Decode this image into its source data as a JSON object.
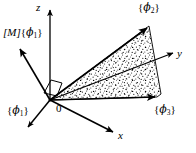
{
  "figure": {
    "background_color": "#ffffff",
    "line_color": "#000000",
    "stipple_color": "#000000",
    "width": 196,
    "height": 153
  },
  "axes": [
    {
      "id": "z",
      "label": "z",
      "from": [
        50,
        100
      ],
      "to": [
        50,
        9
      ],
      "label_pos": [
        37,
        4
      ]
    },
    {
      "id": "y",
      "label": "y",
      "from": [
        50,
        100
      ],
      "to": [
        174,
        53
      ],
      "label_pos": [
        178,
        50
      ]
    },
    {
      "id": "x",
      "label": "x",
      "from": [
        50,
        100
      ],
      "to": [
        114,
        133
      ],
      "label_pos": [
        119,
        132
      ]
    }
  ],
  "origin": {
    "label": "0",
    "pos": [
      50,
      100
    ],
    "label_pos": [
      57,
      106
    ]
  },
  "vectors": [
    {
      "id": "M-phi1",
      "label_parts": {
        "matrix": "[M]",
        "brace_open": "{",
        "symbol": "ϕ",
        "subscript": "1",
        "brace_close": "}"
      },
      "label_text": "[M]{ϕ₁}",
      "from": [
        50,
        100
      ],
      "to": [
        19,
        47
      ],
      "label_pos": [
        4,
        30
      ]
    },
    {
      "id": "phi1",
      "label_parts": {
        "brace_open": "{",
        "symbol": "ϕ",
        "subscript": "1",
        "brace_close": "}"
      },
      "label_text": "{ϕ₁}",
      "from": [
        50,
        100
      ],
      "to": [
        27,
        129
      ],
      "label_pos": [
        8,
        107
      ]
    },
    {
      "id": "phi2",
      "label_parts": {
        "brace_open": "{",
        "symbol": "ϕ",
        "subscript": "2",
        "brace_close": "}"
      },
      "label_text": "{ϕ₂}",
      "from": [
        50,
        100
      ],
      "to": [
        149,
        26
      ],
      "label_pos": [
        139,
        4
      ]
    },
    {
      "id": "phi3",
      "label_parts": {
        "brace_open": "{",
        "symbol": "ϕ",
        "subscript": "3",
        "brace_close": "}"
      },
      "label_text": "{ϕ₃}",
      "from": [
        50,
        100
      ],
      "to": [
        157,
        97
      ],
      "label_pos": [
        156,
        106
      ]
    }
  ],
  "shaded_region": {
    "id": "modal-fan",
    "description": "stippled triangular fan spanned by {ϕ₂} and {ϕ₃}",
    "polygon": [
      [
        50,
        100
      ],
      [
        149,
        26
      ],
      [
        161,
        94
      ],
      [
        157,
        97
      ]
    ],
    "fill_style": "stipple"
  },
  "right_angle_marker": {
    "id": "right-angle",
    "polygon": [
      [
        44,
        93
      ],
      [
        51,
        80
      ],
      [
        62,
        83
      ],
      [
        57,
        96
      ]
    ]
  }
}
